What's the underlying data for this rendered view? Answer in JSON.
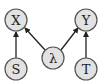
{
  "diagram": {
    "type": "graphical-model",
    "nodes": [
      {
        "id": "X",
        "label": "X",
        "cx": 16,
        "cy": 20
      },
      {
        "id": "Y",
        "label": "Y",
        "cx": 86,
        "cy": 20
      },
      {
        "id": "S",
        "label": "S",
        "cx": 16,
        "cy": 69
      },
      {
        "id": "lambda",
        "label": "λ",
        "cx": 53,
        "cy": 58
      },
      {
        "id": "T",
        "label": "T",
        "cx": 86,
        "cy": 69
      }
    ],
    "edges": [
      {
        "from": "S",
        "to": "X"
      },
      {
        "from": "lambda",
        "to": "X"
      },
      {
        "from": "lambda",
        "to": "Y"
      },
      {
        "from": "T",
        "to": "Y"
      }
    ],
    "colors": {
      "node_fill": "#e2e2e2",
      "node_stroke": "#555555",
      "edge": "#222222"
    }
  }
}
